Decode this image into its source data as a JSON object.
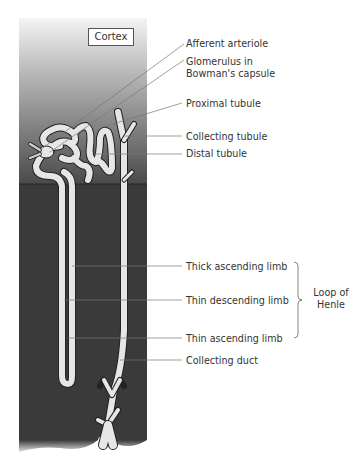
{
  "figure": {
    "region_labels": {
      "cortex": "Cortex"
    },
    "labels": [
      {
        "id": "afferent-arteriole",
        "text": "Afferent arteriole"
      },
      {
        "id": "glomerulus",
        "text": "Glomerulus in",
        "text2": "Bowman's capsule"
      },
      {
        "id": "proximal-tubule",
        "text": "Proximal tubule"
      },
      {
        "id": "collecting-tubule",
        "text": "Collecting tubule"
      },
      {
        "id": "distal-tubule",
        "text": "Distal tubule"
      },
      {
        "id": "thick-ascending-limb",
        "text": "Thick ascending limb"
      },
      {
        "id": "thin-descending-limb",
        "text": "Thin descending limb"
      },
      {
        "id": "thin-ascending-limb",
        "text": "Thin ascending limb"
      },
      {
        "id": "collecting-duct",
        "text": "Collecting duct"
      }
    ],
    "group_label": {
      "line1": "Loop of",
      "line2": "Henle"
    },
    "colors": {
      "cortex_top": "#f2f2f2",
      "cortex_bottom": "#4a4a4a",
      "medulla": "#3a3a3a",
      "tubule_fill": "#e6e6e6",
      "tubule_outline": "#222222",
      "leader_line": "#777777",
      "text": "#333333"
    }
  }
}
